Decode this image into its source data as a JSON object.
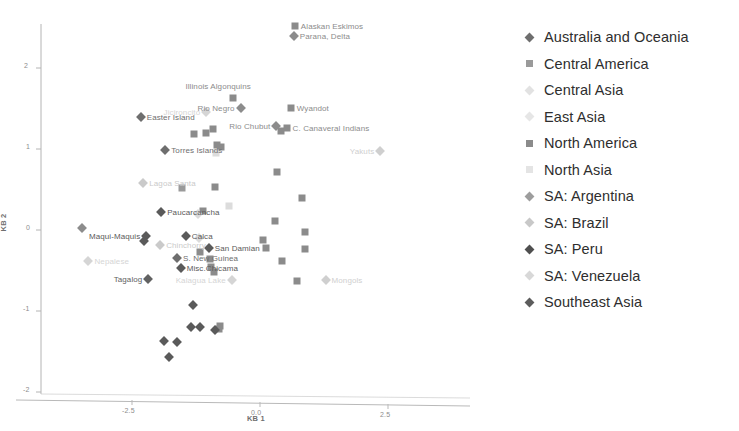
{
  "chart_data": {
    "type": "scatter",
    "title": "",
    "xlabel": "KB 1",
    "ylabel": "KB 2",
    "xlim": [
      -3.6,
      4.2
    ],
    "ylim": [
      -2.25,
      2.75
    ],
    "xticks": [
      -2.5,
      0.0,
      2.5
    ],
    "xticklabels": [
      "-2.5",
      "0.0",
      "2.5"
    ],
    "yticks": [
      2,
      1,
      0,
      -1,
      -2
    ],
    "yticklabels": [
      "2",
      "1",
      "0",
      "-1",
      "-2"
    ],
    "grid": false,
    "legend_position": "right",
    "series": [
      {
        "name": "Australia and Oceania",
        "marker": "diamond",
        "color": "#6e6e6e",
        "points": [
          {
            "x": -2.33,
            "y": 1.39,
            "label": "Easter Island",
            "label_pos": "right"
          },
          {
            "x": -1.85,
            "y": 0.99,
            "label": "Torres Islands",
            "label_pos": "right"
          },
          {
            "x": -1.62,
            "y": -0.34,
            "label": "S. New Guinea",
            "label_pos": "right"
          }
        ]
      },
      {
        "name": "Central America",
        "marker": "square",
        "color": "#9a9a9a",
        "points": [
          {
            "x": -1.52,
            "y": 0.52,
            "label": "",
            "label_pos": "right"
          }
        ]
      },
      {
        "name": "Central Asia",
        "marker": "diamond",
        "color": "#cfcfcf",
        "points": [
          {
            "x": 2.35,
            "y": 0.98,
            "label": "Yakuts",
            "label_pos": "left"
          },
          {
            "x": 1.28,
            "y": -0.62,
            "label": "Mongols",
            "label_pos": "right"
          }
        ]
      },
      {
        "name": "East Asia",
        "marker": "diamond",
        "color": "#d5d5d5",
        "points": [
          {
            "x": -1.05,
            "y": 1.46,
            "label": "Jicironcito",
            "label_pos": "left"
          },
          {
            "x": -0.55,
            "y": -0.62,
            "label": "Kalagua Lake",
            "label_pos": "left"
          },
          {
            "x": -3.35,
            "y": -0.38,
            "label": "Nepalese",
            "label_pos": "right"
          }
        ]
      },
      {
        "name": "North America",
        "marker": "square",
        "color": "#8b8b8b",
        "points": [
          {
            "x": 0.68,
            "y": 2.52,
            "label": "Alaskan Eskimos",
            "label_pos": "right"
          },
          {
            "x": -0.52,
            "y": 1.63,
            "label": "Illinois Algonquins",
            "label_pos": "above"
          },
          {
            "x": 0.6,
            "y": 1.51,
            "label": "Wyandot",
            "label_pos": "right"
          },
          {
            "x": 0.52,
            "y": 1.26,
            "label": "C. Canaveral Indians",
            "label_pos": "right"
          },
          {
            "x": 0.41,
            "y": 1.22,
            "label": "",
            "label_pos": "right"
          },
          {
            "x": -1.28,
            "y": 1.19,
            "label": "",
            "label_pos": "right"
          },
          {
            "x": -1.05,
            "y": 1.2,
            "label": "",
            "label_pos": "right"
          },
          {
            "x": -0.92,
            "y": 1.25,
            "label": "",
            "label_pos": "right"
          },
          {
            "x": -0.84,
            "y": 1.05,
            "label": "",
            "label_pos": "right"
          },
          {
            "x": -0.76,
            "y": 1.03,
            "label": "",
            "label_pos": "right"
          },
          {
            "x": 0.33,
            "y": 0.72,
            "label": "",
            "label_pos": "right"
          },
          {
            "x": -0.88,
            "y": 0.53,
            "label": "",
            "label_pos": "right"
          },
          {
            "x": 0.83,
            "y": 0.4,
            "label": "",
            "label_pos": "right"
          },
          {
            "x": -1.12,
            "y": 0.24,
            "label": "",
            "label_pos": "right"
          },
          {
            "x": 0.3,
            "y": 0.11,
            "label": "",
            "label_pos": "right"
          },
          {
            "x": 0.88,
            "y": -0.02,
            "label": "",
            "label_pos": "right"
          },
          {
            "x": 0.05,
            "y": -0.12,
            "label": "",
            "label_pos": "right"
          },
          {
            "x": 0.12,
            "y": -0.22,
            "label": "",
            "label_pos": "right"
          },
          {
            "x": 0.88,
            "y": -0.24,
            "label": "",
            "label_pos": "right"
          },
          {
            "x": -1.18,
            "y": -0.27,
            "label": "",
            "label_pos": "right"
          },
          {
            "x": 0.42,
            "y": -0.38,
            "label": "",
            "label_pos": "right"
          },
          {
            "x": -0.98,
            "y": -0.36,
            "label": "",
            "label_pos": "right"
          },
          {
            "x": -0.95,
            "y": -0.46,
            "label": "",
            "label_pos": "right"
          },
          {
            "x": -0.9,
            "y": -0.52,
            "label": "",
            "label_pos": "right"
          },
          {
            "x": 0.72,
            "y": -0.63,
            "label": "",
            "label_pos": "right"
          },
          {
            "x": -0.78,
            "y": -1.18,
            "label": "",
            "label_pos": "right"
          },
          {
            "x": -0.8,
            "y": -1.22,
            "label": "",
            "label_pos": "right"
          }
        ]
      },
      {
        "name": "North Asia",
        "marker": "square",
        "color": "#dcdcdc",
        "points": [
          {
            "x": -0.85,
            "y": 0.95,
            "label": "",
            "label_pos": "right"
          },
          {
            "x": -0.6,
            "y": 0.3,
            "label": "",
            "label_pos": "right"
          }
        ]
      },
      {
        "name": "SA: Argentina",
        "marker": "diamond",
        "color": "#8c8c8c",
        "points": [
          {
            "x": 0.66,
            "y": 2.4,
            "label": "Parana, Delta",
            "label_pos": "right"
          },
          {
            "x": -0.38,
            "y": 1.51,
            "label": "Rio Negro",
            "label_pos": "left"
          },
          {
            "x": 0.32,
            "y": 1.28,
            "label": "Rio Chubut",
            "label_pos": "left"
          },
          {
            "x": -3.48,
            "y": 0.02,
            "label": "",
            "label_pos": "right"
          }
        ]
      },
      {
        "name": "SA: Brazil",
        "marker": "diamond",
        "color": "#cacaca",
        "points": [
          {
            "x": -2.28,
            "y": 0.58,
            "label": "Lagoa Santa",
            "label_pos": "right"
          },
          {
            "x": -1.95,
            "y": -0.18,
            "label": "Chinchorry",
            "label_pos": "right"
          }
        ]
      },
      {
        "name": "SA: Peru",
        "marker": "diamond",
        "color": "#5a5a5a",
        "points": [
          {
            "x": -1.93,
            "y": 0.22,
            "label": "Paucarcancha",
            "label_pos": "right"
          },
          {
            "x": -1.45,
            "y": -0.07,
            "label": "Calca",
            "label_pos": "right"
          },
          {
            "x": -2.22,
            "y": -0.08,
            "label": "Maqui-Maquis",
            "label_pos": "left"
          },
          {
            "x": -2.26,
            "y": -0.13,
            "label": "",
            "label_pos": "right"
          },
          {
            "x": -1.0,
            "y": -0.22,
            "label": "San Damian",
            "label_pos": "right"
          },
          {
            "x": -1.55,
            "y": -0.47,
            "label": "Misc.Chicama",
            "label_pos": "right"
          },
          {
            "x": -1.3,
            "y": -0.93,
            "label": "",
            "label_pos": "right"
          },
          {
            "x": -1.35,
            "y": -1.2,
            "label": "",
            "label_pos": "right"
          },
          {
            "x": -1.18,
            "y": -1.2,
            "label": "",
            "label_pos": "right"
          },
          {
            "x": -1.62,
            "y": -1.38,
            "label": "",
            "label_pos": "right"
          },
          {
            "x": -1.88,
            "y": -1.37,
            "label": "",
            "label_pos": "right"
          },
          {
            "x": -1.78,
            "y": -1.57,
            "label": "",
            "label_pos": "right"
          },
          {
            "x": -0.88,
            "y": -1.23,
            "label": "",
            "label_pos": "right"
          }
        ]
      },
      {
        "name": "SA: Venezuela",
        "marker": "diamond",
        "color": "#dadada",
        "points": [
          {
            "x": -1.22,
            "y": 0.2,
            "label": "",
            "label_pos": "right"
          },
          {
            "x": -1.2,
            "y": -0.1,
            "label": "",
            "label_pos": "right"
          }
        ]
      },
      {
        "name": "Southeast Asia",
        "marker": "diamond",
        "color": "#616161",
        "points": [
          {
            "x": -2.18,
            "y": -0.61,
            "label": "Tagalog",
            "label_pos": "left"
          }
        ]
      }
    ],
    "legend": [
      {
        "name": "Australia and Oceania",
        "marker": "diamond",
        "color": "#6e6e6e"
      },
      {
        "name": "Central America",
        "marker": "square",
        "color": "#9a9a9a"
      },
      {
        "name": "Central Asia",
        "marker": "diamond",
        "color": "#e2e2e2"
      },
      {
        "name": "East Asia",
        "marker": "diamond",
        "color": "#e6e6e6"
      },
      {
        "name": "North America",
        "marker": "square",
        "color": "#8b8b8b"
      },
      {
        "name": "North Asia",
        "marker": "square",
        "color": "#e4e4e4"
      },
      {
        "name": "SA: Argentina",
        "marker": "diamond",
        "color": "#9d9d9d"
      },
      {
        "name": "SA: Brazil",
        "marker": "diamond",
        "color": "#c8c8c8"
      },
      {
        "name": "SA: Peru",
        "marker": "diamond",
        "color": "#4f4f4f"
      },
      {
        "name": "SA: Venezuela",
        "marker": "diamond",
        "color": "#d8d8d8"
      },
      {
        "name": "Southeast Asia",
        "marker": "diamond",
        "color": "#5c5c5c"
      }
    ]
  }
}
